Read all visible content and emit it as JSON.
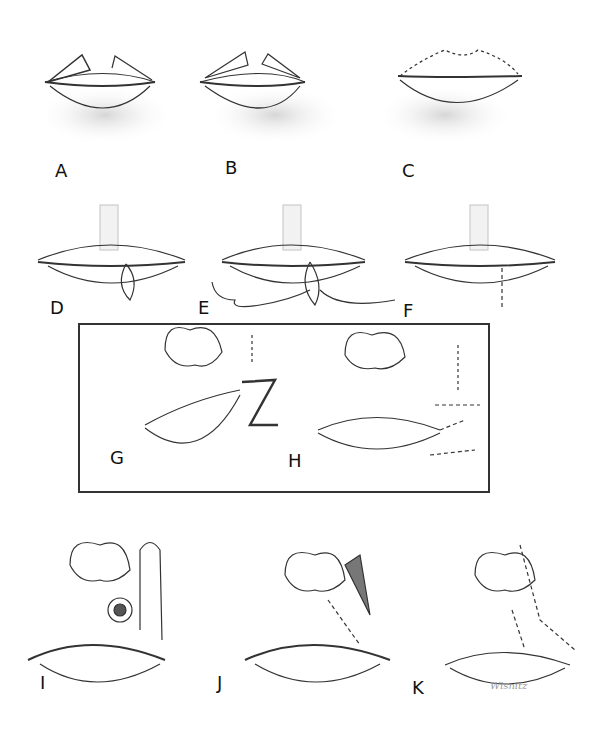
{
  "figure": {
    "panels": [
      {
        "id": "A",
        "label": "A",
        "description": "Upper lip with triangular flap outlines"
      },
      {
        "id": "B",
        "label": "B",
        "description": "Upper lip flaps advanced, hatched"
      },
      {
        "id": "C",
        "label": "C",
        "description": "Upper lip sutured along vermilion border"
      },
      {
        "id": "D",
        "label": "D",
        "description": "Lower lip lesion with elliptical excision outline"
      },
      {
        "id": "E",
        "label": "E",
        "description": "Excision with suture placement"
      },
      {
        "id": "F",
        "label": "F",
        "description": "Lower lip closed with sutures"
      },
      {
        "id": "G",
        "label": "G",
        "description": "Z-plasty outline beside lip and nose"
      },
      {
        "id": "H",
        "label": "H",
        "description": "Z-plasty sutured"
      },
      {
        "id": "I",
        "label": "I",
        "description": "Circular lesion on upper lip with flap outline"
      },
      {
        "id": "J",
        "label": "J",
        "description": "Flap rotated and partially sutured"
      },
      {
        "id": "K",
        "label": "K",
        "description": "Flap fully sutured"
      }
    ],
    "signature": "Wisnitz"
  }
}
